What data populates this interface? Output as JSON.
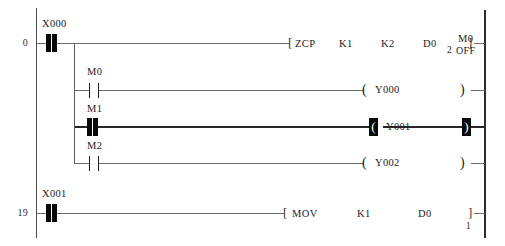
{
  "program": {
    "title": "Ladder Logic Monitor",
    "rungs": [
      {
        "step": "0",
        "contact": {
          "device": "X000",
          "type": "no-energised"
        },
        "instruction": {
          "open_bracket": "[",
          "close_bracket": "]",
          "mnemonic": "ZCP",
          "operands": [
            "K1",
            "K2",
            "D0"
          ],
          "monitor_value": "2",
          "monitor_device": "M0",
          "monitor_state": "OFF"
        }
      },
      {
        "step": "",
        "contact": {
          "device": "M0",
          "type": "no-open"
        },
        "coil": {
          "device": "Y000",
          "open": "(",
          "close": ")",
          "state": "off"
        }
      },
      {
        "step": "",
        "contact": {
          "device": "M1",
          "type": "no-energised"
        },
        "coil": {
          "device": "Y001",
          "open": "(",
          "close": ")",
          "state": "on"
        }
      },
      {
        "step": "",
        "contact": {
          "device": "M2",
          "type": "no-open"
        },
        "coil": {
          "device": "Y002",
          "open": "(",
          "close": ")",
          "state": "off"
        }
      },
      {
        "step": "19",
        "contact": {
          "device": "X001",
          "type": "no-energised"
        },
        "instruction": {
          "open_bracket": "[",
          "close_bracket": "]",
          "mnemonic": "MOV",
          "operands": [
            "K1",
            "D0"
          ],
          "monitor_value": "1"
        }
      }
    ]
  },
  "colors": {
    "rail": "#2b2b2b",
    "wire": "#6b6b6b",
    "wire_energised": "#262626",
    "contact_energised": "#080808",
    "background": "#ffffff"
  }
}
